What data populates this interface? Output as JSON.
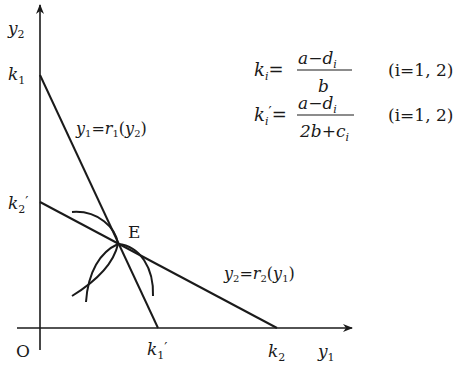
{
  "diagram": {
    "axes": {
      "x_label": "y",
      "x_sub": "1",
      "y_label": "y",
      "y_sub": "2",
      "origin_label": "O"
    },
    "intercepts": {
      "k1": {
        "base": "k",
        "sub": "1",
        "prime": ""
      },
      "k2_prime": {
        "base": "k",
        "sub": "2",
        "prime": "′"
      },
      "k1_prime": {
        "base": "k",
        "sub": "1",
        "prime": "′"
      },
      "k2": {
        "base": "k",
        "sub": "2",
        "prime": ""
      }
    },
    "equilibrium_label": "E",
    "curves": {
      "r1_label": {
        "lhs": "y",
        "lhs_sub": "1",
        "eq": "=",
        "fn": "r",
        "fn_sub": "1",
        "arg": "y",
        "arg_sub": "2"
      },
      "r2_label": {
        "lhs": "y",
        "lhs_sub": "2",
        "eq": "=",
        "fn": "r",
        "fn_sub": "2",
        "arg": "y",
        "arg_sub": "1"
      }
    },
    "formulas": [
      {
        "lhs": "k",
        "lhs_sub": "i",
        "lhs_prime": "",
        "eq": "=",
        "num": "a−d",
        "num_sub": "i",
        "den": "b",
        "den_sub": "",
        "cond": "(i=1, 2)"
      },
      {
        "lhs": "k",
        "lhs_sub": "i",
        "lhs_prime": "′",
        "eq": "=",
        "num": "a−d",
        "num_sub": "i",
        "den": "2b+c",
        "den_sub": "i",
        "cond": "(i=1, 2)"
      }
    ]
  }
}
